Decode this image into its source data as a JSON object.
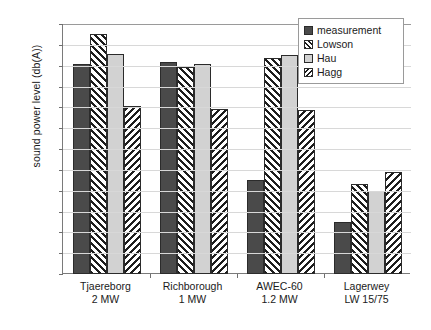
{
  "chart_data": {
    "type": "bar",
    "title": "",
    "xlabel": "",
    "ylabel": "sound power level (db(A))",
    "ylim": [
      90,
      114
    ],
    "ytick_step": 2,
    "yticks": [
      114,
      112,
      110,
      108,
      106,
      104,
      102,
      100,
      98,
      96,
      94,
      92,
      90
    ],
    "grid": true,
    "legend_position": "top-right-inside",
    "categories": [
      {
        "line1": "Tjaereborg",
        "line2": "2 MW"
      },
      {
        "line1": "Richborough",
        "line2": "1 MW"
      },
      {
        "line1": "AWEC-60",
        "line2": "1.2 MW"
      },
      {
        "line1": "Lagerwey",
        "line2": "LW 15/75"
      }
    ],
    "category_labels": [
      "Tjaereborg 2 MW",
      "Richborough 1 MW",
      "AWEC-60 1.2 MW",
      "Lagerwey LW 15/75"
    ],
    "series": [
      {
        "name": "measurement",
        "pattern": "solid-dark",
        "color": "#4a4a4a",
        "values": [
          110.2,
          110.4,
          99.0,
          95.0
        ]
      },
      {
        "name": "Lowson",
        "pattern": "fwd-hatch",
        "color": "#1d1d1d",
        "values": [
          113.0,
          109.9,
          110.7,
          98.6
        ]
      },
      {
        "name": "Hau",
        "pattern": "solid-light",
        "color": "#d2d2d2",
        "values": [
          111.1,
          110.2,
          111.0,
          98.0
        ]
      },
      {
        "name": "Hagg",
        "pattern": "bwd-hatch",
        "color": "#1d1d1d",
        "values": [
          106.1,
          105.8,
          105.7,
          99.8
        ]
      }
    ]
  },
  "legend": {
    "items": [
      {
        "label": "measurement"
      },
      {
        "label": "Lowson"
      },
      {
        "label": "Hau"
      },
      {
        "label": "Hagg"
      }
    ]
  }
}
